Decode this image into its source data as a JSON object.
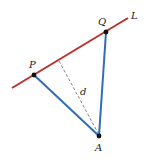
{
  "diagram": {
    "colors": {
      "line_L": "#b8312f",
      "segments": "#2f6db5",
      "dashed": "#777777",
      "points": "#111111"
    },
    "line_L": {
      "label": "L",
      "x1": 12,
      "y1": 88,
      "x2": 128,
      "y2": 18
    },
    "points": [
      {
        "id": "P",
        "label": "P",
        "x": 34,
        "y": 75,
        "lx": 29,
        "ly": 68
      },
      {
        "id": "Q",
        "label": "Q",
        "x": 106,
        "y": 32,
        "lx": 98,
        "ly": 25
      },
      {
        "id": "A",
        "label": "A",
        "x": 99,
        "y": 136,
        "lx": 95,
        "ly": 151
      }
    ],
    "segments": [
      {
        "from": "P",
        "to": "A"
      },
      {
        "from": "Q",
        "to": "A"
      }
    ],
    "perpendicular": {
      "label": "d",
      "x1": 59,
      "y1": 61,
      "x2": 98,
      "y2": 133,
      "lx": 80,
      "ly": 95
    },
    "line_label_pos": {
      "x": 131,
      "y": 19
    }
  }
}
